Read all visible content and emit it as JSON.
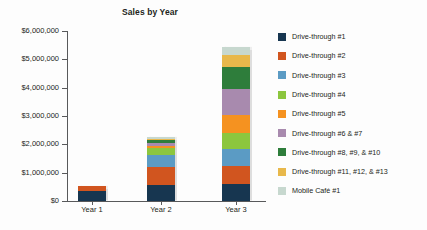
{
  "chart_data": {
    "type": "bar",
    "stacked": true,
    "title": "Sales by Year",
    "xlabel": "",
    "ylabel": "",
    "categories": [
      "Year 1",
      "Year 2",
      "Year 3"
    ],
    "ylim": [
      0,
      6000000
    ],
    "ytick_labels": [
      "$0",
      "$1,000,000",
      "$2,000,000",
      "$3,000,000",
      "$4,000,000",
      "$5,000,000",
      "$6,000,000"
    ],
    "ytick_values": [
      0,
      1000000,
      2000000,
      3000000,
      4000000,
      5000000,
      6000000
    ],
    "grid": false,
    "legend_position": "right",
    "series": [
      {
        "name": "Drive-through #1",
        "color": "#173650",
        "values": [
          370000,
          570000,
          600000
        ]
      },
      {
        "name": "Drive-through #2",
        "color": "#d1551f",
        "values": [
          170000,
          620000,
          620000
        ]
      },
      {
        "name": "Drive-through #3",
        "color": "#5b9bc4",
        "values": [
          0,
          420000,
          600000
        ]
      },
      {
        "name": "Drive-through #4",
        "color": "#8cc63e",
        "values": [
          0,
          270000,
          580000
        ]
      },
      {
        "name": "Drive-through #5",
        "color": "#f59220",
        "values": [
          0,
          75000,
          620000
        ]
      },
      {
        "name": "Drive-through #6 & #7",
        "color": "#a88aae",
        "values": [
          0,
          110000,
          940000
        ]
      },
      {
        "name": "Drive-through #8, #9, & #10",
        "color": "#2e7d3b",
        "values": [
          0,
          85000,
          780000
        ]
      },
      {
        "name": "Drive-through #11, #12, & #13",
        "color": "#e8b84b",
        "values": [
          0,
          45000,
          400000
        ]
      },
      {
        "name": "Mobile Café #1",
        "color": "#c7d8cf",
        "values": [
          0,
          55000,
          290000
        ]
      }
    ]
  }
}
